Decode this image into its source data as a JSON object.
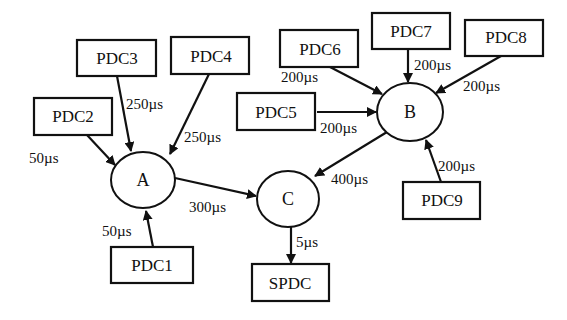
{
  "diagram": {
    "boxes": {
      "pdc1": "PDC1",
      "pdc2": "PDC2",
      "pdc3": "PDC3",
      "pdc4": "PDC4",
      "pdc5": "PDC5",
      "pdc6": "PDC6",
      "pdc7": "PDC7",
      "pdc8": "PDC8",
      "pdc9": "PDC9",
      "spdc": "SPDC"
    },
    "nodes": {
      "a": "A",
      "b": "B",
      "c": "C"
    },
    "edges": {
      "pdc1_a": "50µs",
      "pdc2_a": "50µs",
      "pdc3_a": "250µs",
      "pdc4_a": "250µs",
      "a_c": "300µs",
      "pdc5_b": "200µs",
      "pdc6_b": "200µs",
      "pdc7_b": "200µs",
      "pdc8_b": "200µs",
      "pdc9_b": "200µs",
      "b_c": "400µs",
      "c_spdc": "5µs"
    },
    "colors": {
      "stroke": "#111111",
      "background": "#ffffff"
    }
  }
}
